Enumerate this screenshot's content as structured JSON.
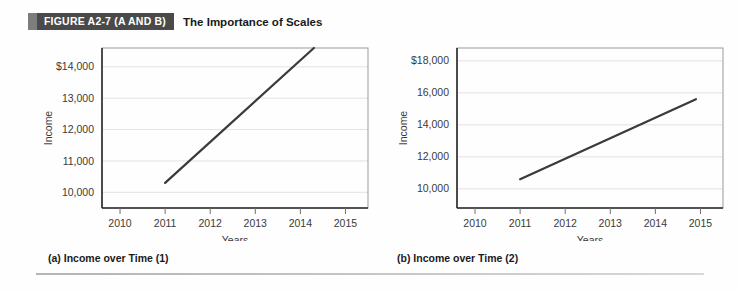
{
  "figure": {
    "badge": "FIGURE A2-7 (A AND B)",
    "title": "The Importance of Scales"
  },
  "panels": [
    {
      "caption": "(a)  Income over Time (1)",
      "chart_data": {
        "type": "line",
        "title": "Income over Time (1)",
        "xlabel": "Years",
        "ylabel": "Income",
        "x": [
          2011,
          2014.3
        ],
        "values": [
          10300,
          14600
        ],
        "xlim": [
          2009.6,
          2015.5
        ],
        "ylim": [
          9500,
          14600
        ],
        "xticks": [
          2010,
          2011,
          2012,
          2013,
          2014,
          2015
        ],
        "xticklabels": [
          "2010",
          "2011",
          "2012",
          "2013",
          "2014",
          "2015"
        ],
        "yticks": [
          10000,
          11000,
          12000,
          13000,
          14000
        ],
        "yticklabels": [
          "10,000",
          "11,000",
          "12,000",
          "13,000",
          "$14,000"
        ],
        "grid": true,
        "legend": "none",
        "line_color": "#3a3a3a"
      }
    },
    {
      "caption": "(b)  Income over Time (2)",
      "chart_data": {
        "type": "line",
        "title": "Income over Time (2)",
        "xlabel": "Years",
        "ylabel": "Income",
        "x": [
          2011,
          2014.9
        ],
        "values": [
          10600,
          15600
        ],
        "xlim": [
          2009.6,
          2015.5
        ],
        "ylim": [
          8800,
          18800
        ],
        "xticks": [
          2010,
          2011,
          2012,
          2013,
          2014,
          2015
        ],
        "xticklabels": [
          "2010",
          "2011",
          "2012",
          "2013",
          "2014",
          "2015"
        ],
        "yticks": [
          10000,
          12000,
          14000,
          16000,
          18000
        ],
        "yticklabels": [
          "10,000",
          "12,000",
          "14,000",
          "16,000",
          "$18,000"
        ],
        "grid": true,
        "legend": "none",
        "line_color": "#3a3a3a"
      }
    }
  ]
}
